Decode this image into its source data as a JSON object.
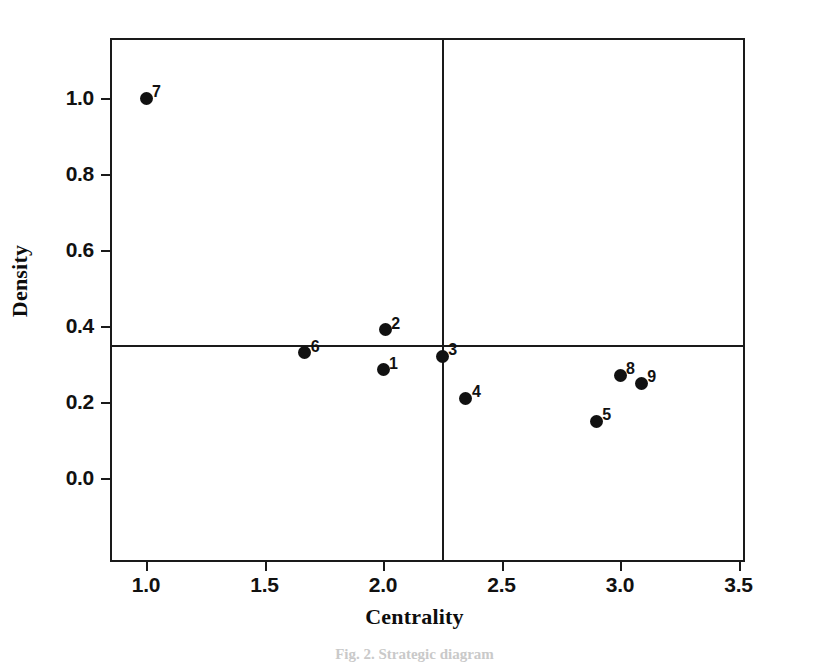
{
  "figure": {
    "caption": "Fig. 2.  Strategic diagram",
    "caption_visible_fragment": "Fig."
  },
  "chart_data": {
    "type": "scatter",
    "title": "",
    "xlabel": "Centrality",
    "ylabel": "Density",
    "xlim": [
      0.78,
      3.46
    ],
    "ylim": [
      -0.22,
      1.19
    ],
    "grid": false,
    "legend": "none",
    "xticks": [
      1.0,
      1.5,
      2.0,
      2.5,
      3.0,
      3.5
    ],
    "xtick_labels": [
      "1.0",
      "1.5",
      "2.0",
      "2.5",
      "3.0",
      "3.5"
    ],
    "yticks": [
      0.0,
      0.2,
      0.4,
      0.6,
      0.8,
      1.0
    ],
    "ytick_labels": [
      "0.0",
      "0.2",
      "0.4",
      "0.6",
      "0.8",
      "1.0"
    ],
    "reference_lines": {
      "vertical_x": 2.25,
      "horizontal_y": 0.35
    },
    "point_labels": [
      "1",
      "2",
      "3",
      "4",
      "5",
      "6",
      "7",
      "8",
      "9"
    ],
    "x": [
      2.0,
      2.01,
      2.25,
      2.35,
      2.9,
      1.67,
      1.0,
      3.0,
      3.09
    ],
    "y": [
      0.285,
      0.39,
      0.32,
      0.21,
      0.15,
      0.33,
      1.0,
      0.27,
      0.25
    ],
    "points": [
      {
        "label": "1",
        "x": 2.0,
        "y": 0.285,
        "label_side": "right"
      },
      {
        "label": "2",
        "x": 2.01,
        "y": 0.39,
        "label_side": "right"
      },
      {
        "label": "3",
        "x": 2.25,
        "y": 0.32,
        "label_side": "right"
      },
      {
        "label": "4",
        "x": 2.35,
        "y": 0.21,
        "label_side": "right"
      },
      {
        "label": "5",
        "x": 2.9,
        "y": 0.15,
        "label_side": "right"
      },
      {
        "label": "6",
        "x": 1.67,
        "y": 0.33,
        "label_side": "right"
      },
      {
        "label": "7",
        "x": 1.0,
        "y": 1.0,
        "label_side": "right"
      },
      {
        "label": "8",
        "x": 3.0,
        "y": 0.27,
        "label_side": "right"
      },
      {
        "label": "9",
        "x": 3.09,
        "y": 0.25,
        "label_side": "right"
      }
    ],
    "colors": {
      "marker": "#111111",
      "axis": "#1a1a1a",
      "background": "#ffffff"
    }
  }
}
